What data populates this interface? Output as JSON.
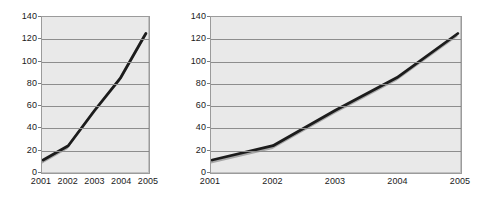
{
  "figure": {
    "background_color": "#ffffff",
    "plot_background_color": "#e9e9e9",
    "gridline_color": "#8d8d8d",
    "frame_color": "#9b9b9b",
    "series_color": "#1c1c1c",
    "shadow_color": "#a8a8a8"
  },
  "chart_data": [
    {
      "id": "left",
      "type": "line",
      "title": "",
      "subtitle": "",
      "xlabel": "",
      "ylabel": "",
      "x": [
        "2001",
        "2002",
        "2003",
        "2004",
        "2005"
      ],
      "categories": [
        "2001",
        "2002",
        "2003",
        "2004",
        "2005"
      ],
      "values": [
        10,
        23,
        55,
        85,
        125
      ],
      "series": [
        {
          "name": "",
          "values": [
            10,
            23,
            55,
            85,
            125
          ],
          "color": "#1c1c1c"
        }
      ],
      "yticks": [
        0,
        20,
        40,
        60,
        80,
        100,
        120,
        140
      ],
      "ytick_labels": [
        "0",
        "20",
        "40",
        "60",
        "80",
        "100",
        "120",
        "140"
      ],
      "ylim": [
        0,
        140
      ],
      "grid": true,
      "grid_axis": "y",
      "legend": false,
      "legend_position": "none",
      "aspect_note": "narrow"
    },
    {
      "id": "right",
      "type": "line",
      "title": "",
      "subtitle": "",
      "xlabel": "",
      "ylabel": "",
      "x": [
        "2001",
        "2002",
        "2003",
        "2004",
        "2005"
      ],
      "categories": [
        "2001",
        "2002",
        "2003",
        "2004",
        "2005"
      ],
      "values": [
        10,
        23,
        55,
        85,
        125
      ],
      "series": [
        {
          "name": "",
          "values": [
            10,
            23,
            55,
            85,
            125
          ],
          "color": "#1c1c1c"
        }
      ],
      "yticks": [
        0,
        20,
        40,
        60,
        80,
        100,
        120,
        140
      ],
      "ytick_labels": [
        "0",
        "20",
        "40",
        "60",
        "80",
        "100",
        "120",
        "140"
      ],
      "ylim": [
        0,
        140
      ],
      "grid": true,
      "grid_axis": "y",
      "legend": false,
      "legend_position": "none",
      "aspect_note": "wide"
    }
  ]
}
